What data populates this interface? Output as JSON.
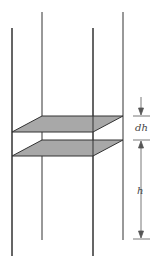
{
  "diagram": {
    "labels": {
      "dh": "dh",
      "h": "h"
    },
    "colors": {
      "line": "#333333",
      "slab_fill": "#a8a8a8",
      "dimension": "#444444"
    }
  }
}
